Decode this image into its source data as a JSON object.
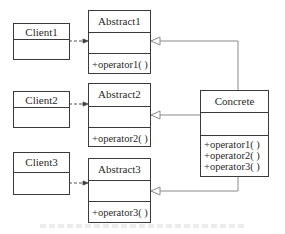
{
  "diagram": {
    "type": "UML class diagram",
    "clients": [
      {
        "name": "Client1",
        "targets": "Abstract1"
      },
      {
        "name": "Client2",
        "targets": "Abstract2"
      },
      {
        "name": "Client3",
        "targets": "Abstract3"
      }
    ],
    "abstracts": [
      {
        "name": "Abstract1",
        "operations": [
          "+operator1( )"
        ]
      },
      {
        "name": "Abstract2",
        "operations": [
          "+operator2( )"
        ]
      },
      {
        "name": "Abstract3",
        "operations": [
          "+operator3( )"
        ]
      }
    ],
    "concrete": {
      "name": "Concrete",
      "operations": [
        "+operator1( )",
        "+operator2( )",
        "+operator3( )"
      ],
      "realizes": [
        "Abstract1",
        "Abstract2",
        "Abstract3"
      ]
    },
    "relations": [
      {
        "from": "Client1",
        "to": "Abstract1",
        "kind": "dependency"
      },
      {
        "from": "Client2",
        "to": "Abstract2",
        "kind": "dependency"
      },
      {
        "from": "Client3",
        "to": "Abstract3",
        "kind": "dependency"
      },
      {
        "from": "Concrete",
        "to": "Abstract1",
        "kind": "generalization"
      },
      {
        "from": "Concrete",
        "to": "Abstract2",
        "kind": "generalization"
      },
      {
        "from": "Concrete",
        "to": "Abstract3",
        "kind": "generalization"
      }
    ],
    "colors": {
      "line": "#3a3a3a",
      "connector": "#8a8a8a",
      "background": "#ffffff"
    }
  }
}
